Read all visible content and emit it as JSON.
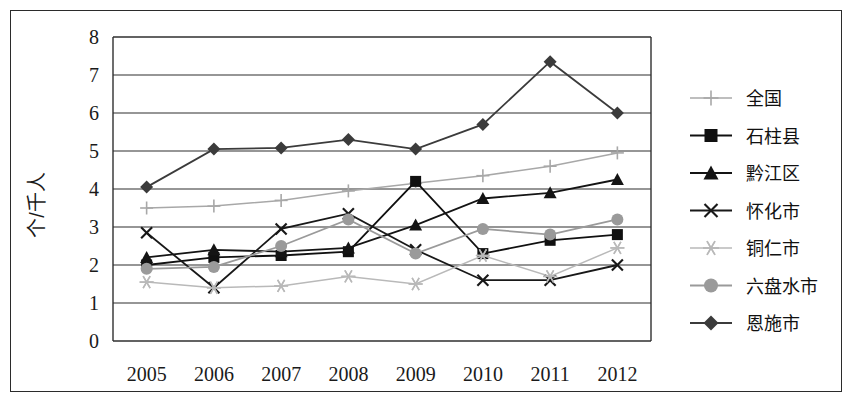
{
  "chart_data": {
    "type": "line",
    "title": "",
    "xlabel": "",
    "ylabel": "个/千人",
    "categories": [
      "2005",
      "2006",
      "2007",
      "2008",
      "2009",
      "2010",
      "2011",
      "2012"
    ],
    "x": [
      2005,
      2006,
      2007,
      2008,
      2009,
      2010,
      2011,
      2012
    ],
    "ylim": [
      0,
      8
    ],
    "yticks": [
      0,
      1,
      2,
      3,
      4,
      5,
      6,
      7,
      8
    ],
    "ytick_labels": [
      "0",
      "1",
      "2",
      "3",
      "4",
      "5",
      "6",
      "7",
      "8"
    ],
    "grid": true,
    "grid_axis": "y",
    "legend_position": "right",
    "series": [
      {
        "name": "全国",
        "marker": "plus",
        "color": "#a8a8a8",
        "values": [
          3.5,
          3.55,
          3.7,
          3.95,
          4.15,
          4.35,
          4.6,
          4.95
        ]
      },
      {
        "name": "石柱县",
        "marker": "square",
        "color": "#101010",
        "values": [
          2.0,
          2.2,
          2.25,
          2.35,
          4.2,
          2.3,
          2.65,
          2.8
        ]
      },
      {
        "name": "黔江区",
        "marker": "triangle",
        "color": "#141414",
        "values": [
          2.2,
          2.4,
          2.35,
          2.45,
          3.05,
          3.75,
          3.9,
          4.25
        ]
      },
      {
        "name": "怀化市",
        "marker": "x",
        "color": "#181818",
        "values": [
          2.85,
          1.4,
          2.95,
          3.35,
          2.4,
          1.6,
          1.6,
          2.0
        ]
      },
      {
        "name": "铜仁市",
        "marker": "asterisk",
        "color": "#b9b9b9",
        "values": [
          1.55,
          1.4,
          1.45,
          1.7,
          1.5,
          2.25,
          1.7,
          2.45
        ]
      },
      {
        "name": "六盘水市",
        "marker": "circle",
        "color": "#9a9a9a",
        "values": [
          1.9,
          1.95,
          2.5,
          3.2,
          2.3,
          2.95,
          2.8,
          3.2
        ]
      },
      {
        "name": "恩施市",
        "marker": "diamond",
        "color": "#3b3b3b",
        "values": [
          4.05,
          5.05,
          5.08,
          5.3,
          5.05,
          5.7,
          7.35,
          6.0
        ]
      }
    ]
  }
}
